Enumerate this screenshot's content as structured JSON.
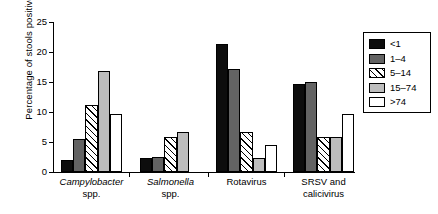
{
  "chart_data": {
    "type": "bar",
    "title": "",
    "subtitle": "",
    "xlabel": "",
    "ylabel": "Percentage of stools positive",
    "ylim": [
      0,
      25
    ],
    "yticks": [
      0,
      5,
      10,
      15,
      20,
      25
    ],
    "ytick_labels": [
      "0",
      "5",
      "10",
      "15",
      "20",
      "25"
    ],
    "grid": false,
    "legend_position": "top-right",
    "legend_title": "",
    "categories": [
      "Campylobacter spp.",
      "Salmonella spp.",
      "Rotavirus",
      "SRSV and calicivirus"
    ],
    "category_lines": [
      [
        "Campylobacter",
        "spp."
      ],
      [
        "Salmonella",
        "spp."
      ],
      [
        "Rotavirus",
        ""
      ],
      [
        "SRSV and",
        "calicivirus"
      ]
    ],
    "category_italic": [
      true,
      true,
      false,
      false
    ],
    "series": [
      {
        "name": "<1",
        "fill": "solid-black",
        "color": "#0d0d0d",
        "values": [
          2.0,
          2.3,
          21.3,
          14.7
        ]
      },
      {
        "name": "1–4",
        "fill": "solid-dark-gray",
        "color": "#636363",
        "values": [
          5.5,
          2.5,
          17.2,
          15.0
        ]
      },
      {
        "name": "5–14",
        "fill": "diagonal-hatch",
        "color": "#ffffff",
        "values": [
          11.1,
          5.9,
          6.6,
          5.9
        ]
      },
      {
        "name": "15–74",
        "fill": "solid-light-gray",
        "color": "#bdbdbd",
        "values": [
          16.9,
          6.6,
          2.3,
          5.9
        ]
      },
      {
        "name": ">74",
        "fill": "solid-white",
        "color": "#ffffff",
        "values": [
          9.7,
          0.0,
          4.5,
          9.6
        ]
      }
    ]
  },
  "legend": {
    "items": [
      {
        "label": "<1"
      },
      {
        "label": "1–4"
      },
      {
        "label": "5–14"
      },
      {
        "label": "15–74"
      },
      {
        "label": ">74"
      }
    ]
  },
  "axis": {
    "y_title": "Percentage of stools positive"
  }
}
